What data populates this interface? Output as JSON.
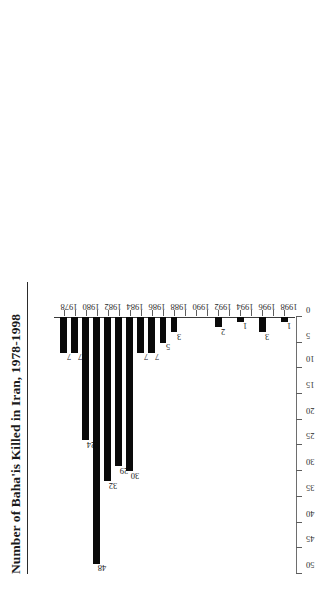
{
  "chart_data": {
    "type": "bar",
    "orientation": "horizontal",
    "title": "Number of Baha'is Killed in Iran, 1978-1998",
    "xlabel": "",
    "ylabel": "",
    "categories": [
      "1978",
      "1979",
      "1980",
      "1981",
      "1982",
      "1983",
      "1984",
      "1985",
      "1986",
      "1987",
      "1988",
      "1989",
      "1990",
      "1991",
      "1992",
      "1993",
      "1994",
      "1995",
      "1996",
      "1997",
      "1998"
    ],
    "values": [
      7,
      7,
      24,
      48,
      32,
      29,
      30,
      7,
      7,
      5,
      3,
      0,
      0,
      0,
      2,
      0,
      1,
      0,
      3,
      0,
      1
    ],
    "value_labels": [
      "7",
      "7",
      "24",
      "48",
      "32",
      "29",
      "30",
      "7",
      "7",
      "5",
      "3",
      "",
      "",
      "",
      "2",
      "",
      "1",
      "",
      "3",
      "",
      "1"
    ],
    "category_tick_labels": [
      "1978",
      "",
      "1980",
      "",
      "1982",
      "",
      "1984",
      "",
      "1986",
      "",
      "1988",
      "",
      "1990",
      "",
      "1992",
      "",
      "1994",
      "",
      "1996",
      "",
      "1998"
    ],
    "value_axis_ticks": [
      0,
      5,
      10,
      15,
      20,
      25,
      30,
      35,
      40,
      45,
      50
    ],
    "value_axis_tick_labels": [
      "0",
      "5",
      "10",
      "15",
      "20",
      "25",
      "30",
      "35",
      "40",
      "45",
      "50"
    ],
    "xlim": [
      0,
      50
    ],
    "grid": false,
    "legend": null,
    "bar_color": "#0a0a0a",
    "background_color": "#ffffff",
    "axis_color": "#5d5d5d"
  }
}
